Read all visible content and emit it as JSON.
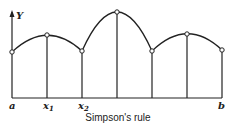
{
  "diagram": {
    "title": "Simpson's rule",
    "axis": {
      "y_label": "Y"
    },
    "x_labels": [
      {
        "main": "a",
        "sub": ""
      },
      {
        "main": "x",
        "sub": "1"
      },
      {
        "main": "x",
        "sub": "2"
      },
      {
        "main": "b",
        "sub": ""
      }
    ],
    "points": [
      {
        "x": 12,
        "y": 52
      },
      {
        "x": 47,
        "y": 35
      },
      {
        "x": 82,
        "y": 51
      },
      {
        "x": 117,
        "y": 12
      },
      {
        "x": 152,
        "y": 51
      },
      {
        "x": 187,
        "y": 34
      },
      {
        "x": 222,
        "y": 50
      }
    ],
    "baseline_y": 98,
    "colors": {
      "stroke": "#222222",
      "background": "#ffffff"
    }
  }
}
